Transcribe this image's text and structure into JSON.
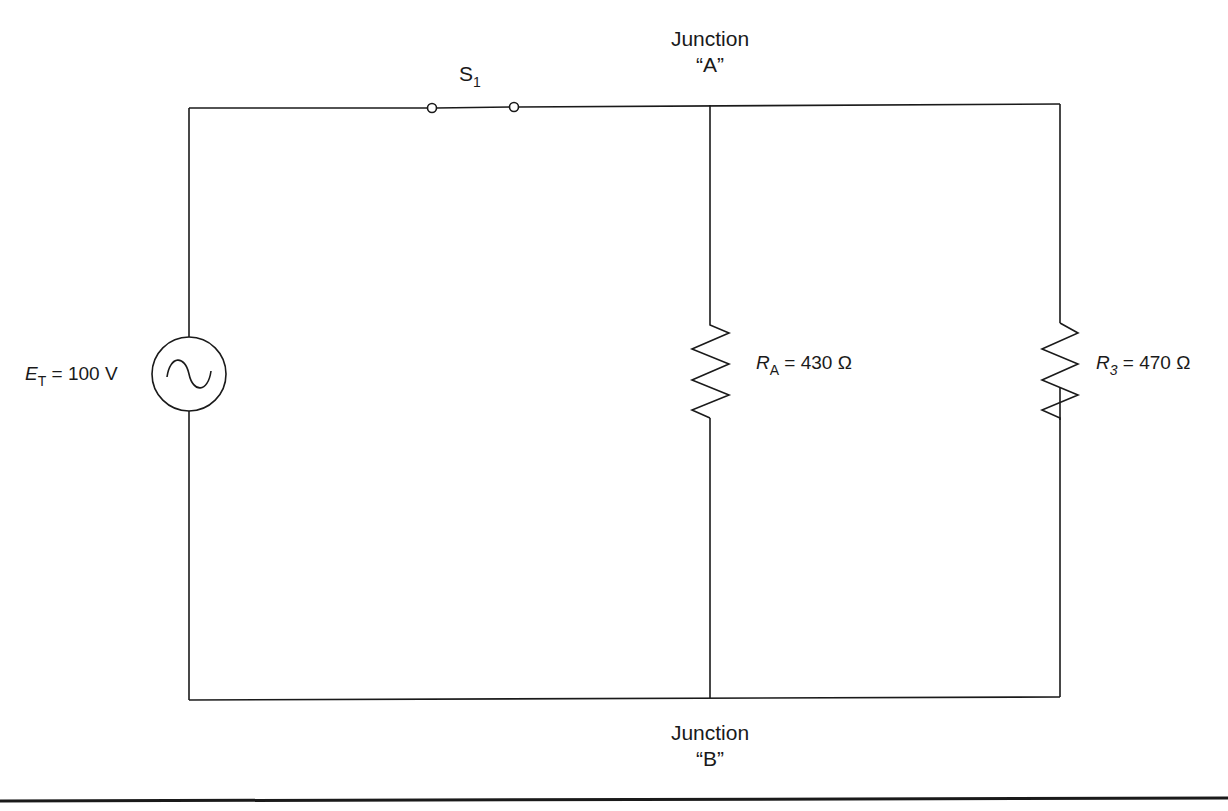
{
  "diagram": {
    "type": "parallel circuit schematic",
    "source": {
      "symbol": "ac-voltage-source",
      "label_main": "E",
      "label_sub": "T",
      "label_value": " = 100 V"
    },
    "switch": {
      "label_main": "S",
      "label_sub": "1"
    },
    "junction_a": {
      "line1": "Junction",
      "line2": "“A”"
    },
    "junction_b": {
      "line1": "Junction",
      "line2": "“B”"
    },
    "resistor_a": {
      "label_main": "R",
      "label_sub": "A",
      "label_value": " = 430 Ω"
    },
    "resistor_3": {
      "label_main": "R",
      "label_sub": "3",
      "label_value": " = 470 Ω"
    },
    "colors": {
      "wire": "#1a1a1a",
      "background": "#ffffff"
    }
  }
}
